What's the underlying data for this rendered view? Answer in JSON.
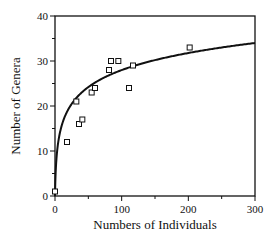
{
  "chart_data": {
    "type": "scatter",
    "title": "",
    "xlabel": "Numbers of Individuals",
    "ylabel": "Number of Genera",
    "xlim": [
      0,
      300
    ],
    "ylim": [
      0,
      40
    ],
    "x_ticks": [
      0,
      100,
      200,
      300
    ],
    "x_minor_ticks": [
      50,
      150,
      250
    ],
    "y_ticks": [
      0,
      10,
      20,
      30,
      40
    ],
    "y_minor_ticks": [
      5,
      15,
      25,
      35
    ],
    "grid": false,
    "legend": null,
    "series": [
      {
        "name": "Observed samples",
        "marker": "open-square",
        "points": [
          {
            "x": 0,
            "y": 1
          },
          {
            "x": 18,
            "y": 12
          },
          {
            "x": 32,
            "y": 21
          },
          {
            "x": 36,
            "y": 16
          },
          {
            "x": 41,
            "y": 17
          },
          {
            "x": 55,
            "y": 23
          },
          {
            "x": 60,
            "y": 24
          },
          {
            "x": 81,
            "y": 28
          },
          {
            "x": 84,
            "y": 30
          },
          {
            "x": 95,
            "y": 30
          },
          {
            "x": 111,
            "y": 24
          },
          {
            "x": 117,
            "y": 29
          },
          {
            "x": 202,
            "y": 33
          }
        ]
      },
      {
        "name": "Fitted curve",
        "type": "line",
        "model": "y = a*ln(1 + b*x)",
        "params": {
          "a": 5.5,
          "b": 1.61
        },
        "x_range": [
          0,
          300
        ]
      }
    ]
  },
  "colors": {
    "axis": "#111111",
    "curve": "#111111",
    "marker": "#111111",
    "background": "#ffffff"
  },
  "layout": {
    "plot_left": 55,
    "plot_right": 255,
    "plot_top": 16,
    "plot_bottom": 196
  }
}
